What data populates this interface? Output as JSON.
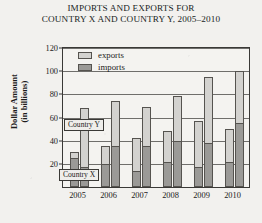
{
  "chart_data": {
    "type": "bar",
    "title": "IMPORTS AND EXPORTS FOR COUNTRY X AND COUNTRY Y, 2005–2010",
    "title_line1": "IMPORTS AND EXPORTS FOR",
    "title_line2": "COUNTRY X AND COUNTRY Y, 2005–2010",
    "xlabel": "",
    "ylabel": "Dollar Amount (in billions)",
    "ylabel_line1": "Dollar Amount",
    "ylabel_line2": "(in billions)",
    "ylim": [
      0,
      120
    ],
    "yticks": [
      20,
      40,
      60,
      80,
      100,
      120
    ],
    "grid": true,
    "legend_position": "top-left-inside",
    "legend": [
      {
        "label": "exports",
        "color": "#d3d2cf"
      },
      {
        "label": "imports",
        "color": "#9b9a97"
      }
    ],
    "categories": [
      "2005",
      "2006",
      "2007",
      "2008",
      "2009",
      "2010"
    ],
    "annotations": [
      {
        "id": "country-y",
        "text": "Country Y"
      },
      {
        "id": "country-x",
        "text": "Country X"
      }
    ],
    "series": [
      {
        "name": "Country X exports",
        "country": "Country X",
        "measure": "exports",
        "color": "#d3d2cf",
        "values": [
          30,
          35,
          42,
          48,
          57,
          50
        ]
      },
      {
        "name": "Country X imports",
        "country": "Country X",
        "measure": "imports",
        "color": "#9b9a97",
        "values": [
          25,
          20,
          14,
          22,
          17,
          22
        ]
      },
      {
        "name": "Country Y exports",
        "country": "Country Y",
        "measure": "exports",
        "color": "#d3d2cf",
        "values": [
          68,
          74,
          69,
          79,
          95,
          100
        ]
      },
      {
        "name": "Country Y imports",
        "country": "Country Y",
        "measure": "imports",
        "color": "#9b9a97",
        "values": [
          17,
          35,
          35,
          40,
          38,
          55
        ]
      }
    ]
  }
}
